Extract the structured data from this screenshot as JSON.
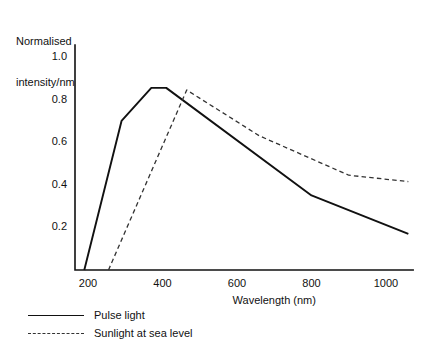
{
  "chart_data": {
    "type": "line",
    "title": "",
    "xlabel": "Wavelength (nm)",
    "ylabel": "Normalised intensity/nm",
    "ylabel_line1": "Normalised",
    "ylabel_line2": "intensity/nm",
    "xlim": [
      160,
      1075
    ],
    "ylim": [
      0,
      1.06
    ],
    "xticks": [
      200,
      400,
      600,
      800,
      1000
    ],
    "xtick_labels": [
      "200",
      "400",
      "600",
      "800",
      "1000"
    ],
    "yticks": [
      0.2,
      0.4,
      0.6,
      0.8,
      1.0
    ],
    "ytick_labels": [
      "0.2",
      "0.4",
      "0.6",
      "0.8",
      "1.0"
    ],
    "grid": false,
    "legend_position": "below-left",
    "series": [
      {
        "name": "Pulse light",
        "style": "solid",
        "color": "#111111",
        "x": [
          190,
          290,
          370,
          410,
          800,
          1060
        ],
        "y": [
          0.0,
          0.7,
          0.855,
          0.855,
          0.35,
          0.17
        ]
      },
      {
        "name": "Sunlight at sea level",
        "style": "dashed",
        "color": "#333333",
        "x": [
          255,
          465,
          660,
          900,
          1060
        ],
        "y": [
          0.0,
          0.845,
          0.63,
          0.445,
          0.415
        ]
      }
    ]
  },
  "axes": {
    "y_axis_label_lines": [
      "Normalised",
      "intensity/nm"
    ],
    "x_axis_title": "Wavelength (nm)"
  },
  "legend": {
    "items": [
      {
        "label": "Pulse light",
        "style": "solid"
      },
      {
        "label": "Sunlight at sea level",
        "style": "dashed"
      }
    ]
  }
}
